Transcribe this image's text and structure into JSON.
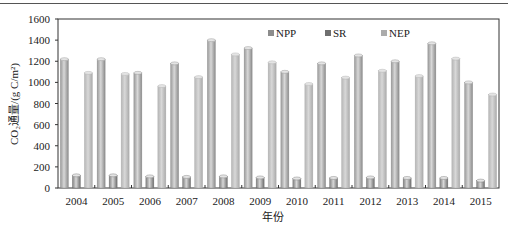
{
  "chart_data": {
    "type": "bar",
    "title": "",
    "xlabel": "年份",
    "ylabel": "CO₂通量/(g C/m²)",
    "ylim": [
      0,
      1600
    ],
    "yticks": [
      0,
      200,
      400,
      600,
      800,
      1000,
      1200,
      1400,
      1600
    ],
    "grid": false,
    "legend_position": "top-center-inside",
    "categories": [
      "2004",
      "2005",
      "2006",
      "2007",
      "2008",
      "2009",
      "2010",
      "2011",
      "2012",
      "2013",
      "2014",
      "2015"
    ],
    "series": [
      {
        "name": "NPP",
        "color": "#8c8c8c",
        "values": [
          1220,
          1220,
          1090,
          1180,
          1400,
          1325,
          1100,
          1180,
          1255,
          1200,
          1370,
          1000
        ]
      },
      {
        "name": "SR",
        "color": "#6f6f6f",
        "values": [
          120,
          120,
          110,
          105,
          110,
          100,
          90,
          95,
          100,
          95,
          95,
          70
        ]
      },
      {
        "name": "NEP",
        "color": "#ababab",
        "values": [
          1090,
          1080,
          965,
          1050,
          1265,
          1190,
          985,
          1045,
          1110,
          1060,
          1225,
          885
        ]
      }
    ]
  },
  "axes": {
    "ylabel": "CO₂通量/(g C/m²)",
    "xlabel": "年份"
  }
}
